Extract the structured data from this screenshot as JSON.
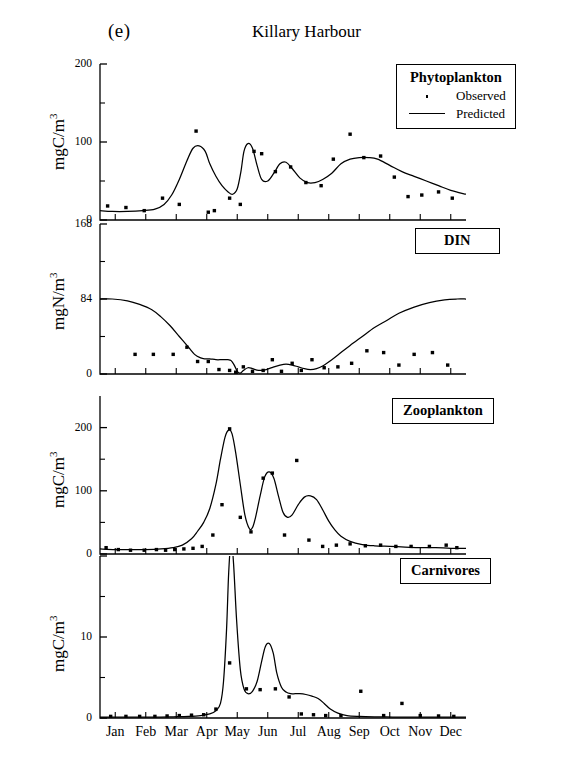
{
  "figure": {
    "panel_letter": "(e)",
    "title": "Killary Harbour"
  },
  "legend": {
    "title": "Phytoplankton",
    "observed_label": "Observed",
    "predicted_label": "Predicted",
    "observed_marker": "dot-marker-icon",
    "predicted_marker": "line-marker-icon"
  },
  "panel_labels": {
    "phytoplankton": "Phytoplankton",
    "din": "DIN",
    "zooplankton": "Zooplankton",
    "carnivores": "Carnivores"
  },
  "axis_titles": {
    "phytoplankton": "mgC/m",
    "din": "mgN/m",
    "zooplankton": "mgC/m",
    "carnivores": "mgC/m",
    "exponent": "3"
  },
  "months": [
    "Jan",
    "Feb",
    "Mar",
    "Apr",
    "May",
    "Jun",
    "Jul",
    "Aug",
    "Sep",
    "Oct",
    "Nov",
    "Dec"
  ],
  "colors": {
    "line": "#000000",
    "marker": "#000000",
    "axis": "#000000",
    "background": "#ffffff"
  },
  "chart_data": [
    {
      "type": "line",
      "id": "phytoplankton",
      "title": "Phytoplankton",
      "xlabel": "",
      "ylabel": "mgC/m3",
      "ylim": [
        0,
        200
      ],
      "yticks": [
        0,
        100,
        200
      ],
      "ytick_labels": [
        "0",
        "100",
        "200"
      ],
      "yminor": [
        50,
        150
      ],
      "xlim": [
        0,
        12
      ],
      "xticks": [
        0.5,
        1.5,
        2.5,
        3.5,
        4.5,
        5.5,
        6.5,
        7.5,
        8.5,
        9.5,
        10.5,
        11.5
      ],
      "xtick_labels": [
        "Jan",
        "Feb",
        "Mar",
        "Apr",
        "May",
        "Jun",
        "Jul",
        "Aug",
        "Sep",
        "Oct",
        "Nov",
        "Dec"
      ],
      "grid": false,
      "legend": "inside-top-right",
      "series": [
        {
          "name": "Predicted",
          "style": "line",
          "x": [
            0.0,
            0.4,
            0.9,
            1.4,
            1.8,
            2.1,
            2.35,
            2.6,
            2.85,
            3.05,
            3.25,
            3.45,
            3.6,
            3.8,
            4.0,
            4.2,
            4.35,
            4.5,
            4.62,
            4.72,
            4.85,
            5.0,
            5.15,
            5.3,
            5.5,
            5.7,
            5.9,
            6.1,
            6.3,
            6.55,
            6.8,
            7.05,
            7.3,
            7.6,
            7.9,
            8.2,
            8.5,
            8.8,
            9.1,
            9.5,
            9.9,
            10.3,
            10.7,
            11.1,
            11.5,
            12.0
          ],
          "y": [
            12,
            11,
            11,
            12,
            14,
            20,
            32,
            52,
            76,
            92,
            95,
            88,
            72,
            56,
            44,
            36,
            33,
            40,
            62,
            88,
            98,
            92,
            70,
            52,
            50,
            60,
            72,
            74,
            66,
            54,
            48,
            48,
            52,
            60,
            72,
            78,
            80,
            80,
            78,
            70,
            62,
            56,
            50,
            44,
            38,
            33
          ]
        },
        {
          "name": "Observed",
          "style": "points",
          "x": [
            0.25,
            0.85,
            1.45,
            2.05,
            2.6,
            3.15,
            3.55,
            3.75,
            4.25,
            4.6,
            5.05,
            5.3,
            5.75,
            6.25,
            6.75,
            7.25,
            7.65,
            8.2,
            8.65,
            9.2,
            9.65,
            10.1,
            10.55,
            11.1,
            11.55
          ],
          "y": [
            18,
            16,
            12,
            28,
            20,
            114,
            10,
            12,
            28,
            20,
            88,
            85,
            62,
            68,
            48,
            44,
            78,
            110,
            80,
            82,
            55,
            30,
            32,
            36,
            28
          ]
        }
      ]
    },
    {
      "type": "line",
      "id": "din",
      "title": "DIN",
      "xlabel": "",
      "ylabel": "mgN/m3",
      "ylim": [
        0,
        168
      ],
      "yticks": [
        0,
        84,
        168
      ],
      "ytick_labels": [
        "0",
        "84",
        "168"
      ],
      "yminor": [
        42,
        126
      ],
      "xlim": [
        0,
        12
      ],
      "xticks": [
        0.5,
        1.5,
        2.5,
        3.5,
        4.5,
        5.5,
        6.5,
        7.5,
        8.5,
        9.5,
        10.5,
        11.5
      ],
      "xtick_labels": [
        "Jan",
        "Feb",
        "Mar",
        "Apr",
        "May",
        "Jun",
        "Jul",
        "Aug",
        "Sep",
        "Oct",
        "Nov",
        "Dec"
      ],
      "grid": false,
      "series": [
        {
          "name": "Predicted",
          "style": "line",
          "x": [
            0.0,
            0.4,
            0.9,
            1.3,
            1.7,
            2.0,
            2.3,
            2.6,
            2.9,
            3.1,
            3.3,
            3.45,
            3.6,
            3.8,
            4.0,
            4.2,
            4.3,
            4.4,
            4.5,
            4.6,
            4.7,
            4.85,
            5.0,
            5.2,
            5.45,
            5.7,
            5.9,
            6.1,
            6.3,
            6.5,
            6.7,
            6.9,
            7.1,
            7.3,
            7.6,
            7.9,
            8.2,
            8.6,
            9.0,
            9.4,
            9.8,
            10.3,
            10.8,
            11.3,
            11.7,
            12.0
          ],
          "y": [
            84,
            84,
            82,
            78,
            72,
            64,
            54,
            42,
            30,
            22,
            18,
            17,
            17,
            16,
            16,
            16,
            15,
            10,
            3,
            1,
            4,
            7,
            6,
            4,
            5,
            8,
            10,
            11,
            10,
            8,
            6,
            5,
            6,
            9,
            16,
            24,
            32,
            42,
            52,
            60,
            68,
            75,
            80,
            83,
            84,
            84
          ]
        },
        {
          "name": "Observed",
          "style": "points",
          "x": [
            1.15,
            1.75,
            2.4,
            2.85,
            3.2,
            3.55,
            3.9,
            4.25,
            4.45,
            4.7,
            5.0,
            5.35,
            5.65,
            5.95,
            6.3,
            6.6,
            6.95,
            7.35,
            7.8,
            8.25,
            8.75,
            9.3,
            9.8,
            10.3,
            10.9,
            11.4
          ],
          "y": [
            22,
            22,
            22,
            30,
            14,
            14,
            5,
            4,
            2,
            8,
            3,
            4,
            16,
            3,
            12,
            4,
            16,
            7,
            8,
            12,
            26,
            24,
            10,
            22,
            24,
            10
          ]
        }
      ]
    },
    {
      "type": "line",
      "id": "zooplankton",
      "title": "Zooplankton",
      "xlabel": "",
      "ylabel": "mgC/m3",
      "ylim": [
        0,
        250
      ],
      "yticks": [
        0,
        100,
        200
      ],
      "ytick_labels": [
        "0",
        "100",
        "200"
      ],
      "yminor": [
        50,
        150
      ],
      "xlim": [
        0,
        12
      ],
      "xticks": [
        0.5,
        1.5,
        2.5,
        3.5,
        4.5,
        5.5,
        6.5,
        7.5,
        8.5,
        9.5,
        10.5,
        11.5
      ],
      "xtick_labels": [
        "Jan",
        "Feb",
        "Mar",
        "Apr",
        "May",
        "Jun",
        "Jul",
        "Aug",
        "Sep",
        "Oct",
        "Nov",
        "Dec"
      ],
      "grid": false,
      "series": [
        {
          "name": "Predicted",
          "style": "line",
          "x": [
            0.0,
            0.5,
            1.0,
            1.5,
            2.0,
            2.4,
            2.7,
            3.0,
            3.2,
            3.4,
            3.6,
            3.8,
            3.95,
            4.1,
            4.22,
            4.33,
            4.45,
            4.6,
            4.75,
            4.9,
            5.0,
            5.1,
            5.25,
            5.4,
            5.55,
            5.7,
            5.85,
            6.0,
            6.15,
            6.3,
            6.5,
            6.7,
            6.9,
            7.1,
            7.3,
            7.5,
            7.7,
            7.9,
            8.2,
            8.6,
            9.0,
            9.5,
            10.0,
            10.5,
            11.0,
            11.5,
            12.0
          ],
          "y": [
            8,
            7,
            7,
            7,
            8,
            10,
            14,
            24,
            36,
            50,
            72,
            110,
            150,
            185,
            196,
            190,
            160,
            110,
            62,
            40,
            42,
            58,
            92,
            122,
            130,
            120,
            92,
            66,
            58,
            62,
            78,
            90,
            92,
            86,
            70,
            52,
            38,
            28,
            20,
            15,
            13,
            12,
            11,
            10,
            10,
            9,
            9
          ]
        },
        {
          "name": "Observed",
          "style": "points",
          "x": [
            0.2,
            0.6,
            1.0,
            1.45,
            1.85,
            2.15,
            2.45,
            2.75,
            3.05,
            3.35,
            3.7,
            4.0,
            4.25,
            4.6,
            4.95,
            5.35,
            5.65,
            6.05,
            6.45,
            6.85,
            7.3,
            7.75,
            8.2,
            8.7,
            9.2,
            9.7,
            10.2,
            10.8,
            11.35,
            11.7
          ],
          "y": [
            10,
            7,
            6,
            6,
            7,
            6,
            7,
            8,
            9,
            12,
            30,
            78,
            198,
            58,
            35,
            120,
            128,
            30,
            148,
            22,
            12,
            14,
            16,
            13,
            14,
            12,
            12,
            12,
            14,
            10
          ]
        }
      ]
    },
    {
      "type": "line",
      "id": "carnivores",
      "title": "Carnivores",
      "xlabel": "",
      "ylabel": "mgC/m3",
      "ylim": [
        0,
        20
      ],
      "yticks": [
        0,
        10,
        20
      ],
      "ytick_labels": [
        "0",
        "10",
        ""
      ],
      "yminor": [
        5,
        15
      ],
      "xlim": [
        0,
        12
      ],
      "xticks": [
        0.5,
        1.5,
        2.5,
        3.5,
        4.5,
        5.5,
        6.5,
        7.5,
        8.5,
        9.5,
        10.5,
        11.5
      ],
      "xtick_labels": [
        "Jan",
        "Feb",
        "Mar",
        "Apr",
        "May",
        "Jun",
        "Jul",
        "Aug",
        "Sep",
        "Oct",
        "Nov",
        "Dec"
      ],
      "grid": false,
      "series": [
        {
          "name": "Predicted",
          "style": "line",
          "x": [
            0.0,
            0.6,
            1.2,
            1.8,
            2.4,
            2.9,
            3.3,
            3.6,
            3.8,
            3.95,
            4.05,
            4.15,
            4.22,
            4.3,
            4.38,
            4.48,
            4.6,
            4.72,
            4.85,
            5.0,
            5.15,
            5.3,
            5.42,
            5.55,
            5.68,
            5.8,
            5.95,
            6.1,
            6.25,
            6.4,
            6.55,
            6.75,
            6.95,
            7.15,
            7.35,
            7.55,
            7.8,
            8.1,
            8.5,
            9.0,
            9.6,
            10.2,
            10.9,
            11.5,
            12.0
          ],
          "y": [
            0.1,
            0.1,
            0.1,
            0.1,
            0.15,
            0.2,
            0.3,
            0.5,
            0.9,
            1.8,
            4.5,
            11,
            18,
            22,
            19,
            12,
            6,
            3.6,
            3.0,
            3.3,
            4.5,
            7.0,
            8.8,
            9.2,
            8.0,
            5.5,
            3.8,
            3.2,
            3.0,
            3.0,
            3.0,
            2.9,
            2.7,
            2.4,
            1.8,
            1.1,
            0.6,
            0.3,
            0.2,
            0.15,
            0.12,
            0.1,
            0.1,
            0.1,
            0.1
          ]
        },
        {
          "name": "Observed",
          "style": "points",
          "x": [
            0.35,
            0.85,
            1.3,
            1.8,
            2.2,
            2.6,
            3.0,
            3.4,
            3.8,
            4.25,
            4.8,
            5.25,
            5.75,
            6.2,
            6.6,
            7.0,
            7.4,
            7.9,
            8.55,
            9.3,
            9.9,
            10.5,
            11.1,
            11.6
          ],
          "y": [
            0.2,
            0.2,
            0.2,
            0.2,
            0.25,
            0.3,
            0.35,
            0.4,
            1.1,
            6.8,
            3.6,
            3.5,
            3.6,
            2.6,
            0.5,
            0.4,
            0.3,
            0.3,
            3.3,
            0.3,
            1.8,
            0.3,
            0.25,
            0.2
          ]
        }
      ]
    }
  ]
}
